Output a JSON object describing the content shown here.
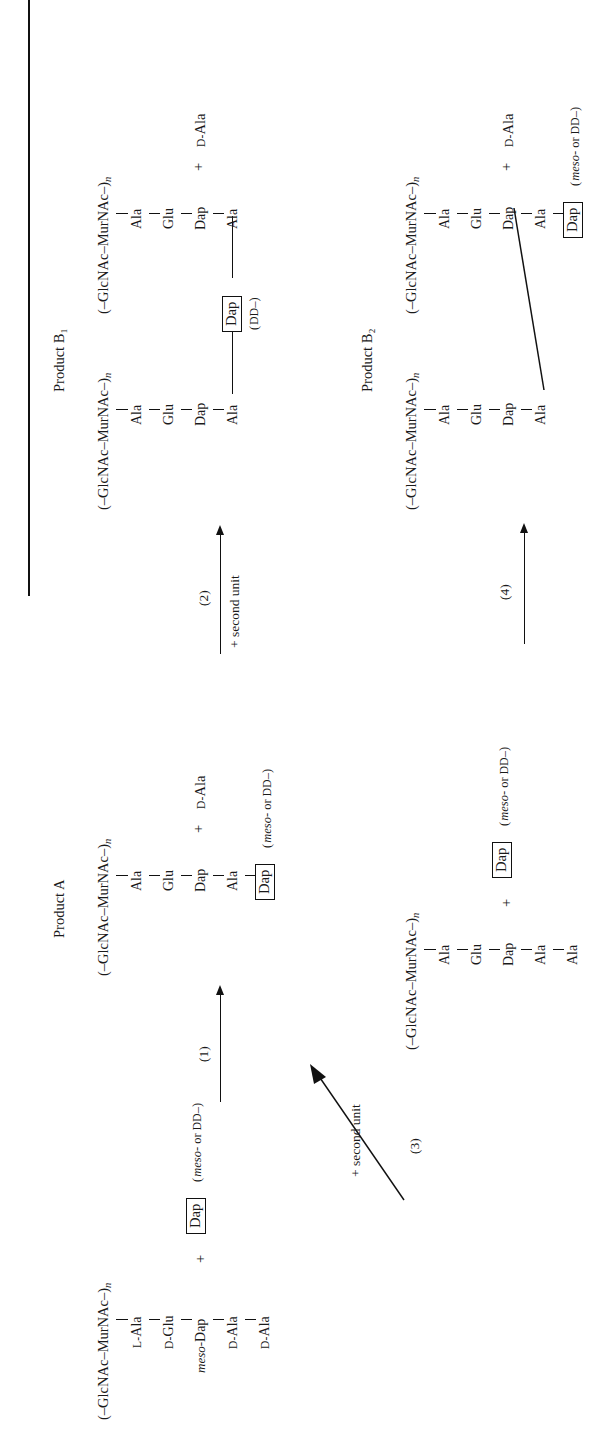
{
  "figure": {
    "orientation": "rotated-90-ccw",
    "rule_label": "figure-top-rule"
  },
  "titles": {
    "product_a": "Product A",
    "product_b1": "Product B₁",
    "product_b2": "Product B₂"
  },
  "glycan_backbone": {
    "prefix": "(–GlcNAc–MurNAc–)",
    "subscript": "n"
  },
  "substrate": {
    "name": "substrate-pentapeptide",
    "backbone": "(–GlcNAc–MurNAc–)",
    "backbone_sub": "n",
    "residues": [
      {
        "prefix": "L-",
        "label": "Ala",
        "style": "smallcaps"
      },
      {
        "prefix": "D-",
        "label": "Glu",
        "style": "smallcaps"
      },
      {
        "prefix": "meso-",
        "label": "Dap",
        "style": "italic"
      },
      {
        "prefix": "D-",
        "label": "Ala",
        "style": "smallcaps"
      },
      {
        "prefix": "D-",
        "label": "Ala",
        "style": "smallcaps"
      }
    ],
    "plus": "+",
    "acceptor_boxed": "Dap",
    "acceptor_note": "( meso- or DD–)"
  },
  "product_a": {
    "name": "product-a-structure",
    "backbone": "(–GlcNAc–MurNAc–)",
    "backbone_sub": "n",
    "residues": [
      "Ala",
      "Glu",
      "Dap",
      "Ala"
    ],
    "boxed_residue": "Dap",
    "boxed_note": "( meso- or DD–)",
    "released": "+ D-Ala",
    "released_plus": "+",
    "released_prefix": "D-",
    "released_label": "Ala"
  },
  "product_b1": {
    "name": "product-b1-structure",
    "left_chain": {
      "backbone": "(–GlcNAc–MurNAc–)",
      "backbone_sub": "n",
      "residues": [
        "Ala",
        "Glu",
        "Dap",
        "Ala"
      ]
    },
    "right_chain": {
      "backbone": "(–GlcNAc–MurNAc–)",
      "backbone_sub": "n",
      "residues": [
        "Ala",
        "Glu",
        "Dap",
        "Ala"
      ]
    },
    "bridge_boxed": "Dap",
    "bridge_note": "( DD–)",
    "released_plus": "+",
    "released_prefix": "D-",
    "released_label": "Ala"
  },
  "intermediate": {
    "name": "intermediate-tetra-plus-ala",
    "backbone": "(–GlcNAc–MurNAc–)",
    "backbone_sub": "n",
    "residues": [
      "Ala",
      "Glu",
      "Dap",
      "Ala",
      "Ala"
    ],
    "plus": "+",
    "acceptor_boxed": "Dap",
    "acceptor_note": "( meso- or DD–)",
    "released_plus": "+",
    "released_prefix": "D-",
    "released_label": "Ala"
  },
  "product_b2": {
    "name": "product-b2-structure",
    "left_chain": {
      "backbone": "(–GlcNAc–MurNAc–)",
      "backbone_sub": "n",
      "residues": [
        "Ala",
        "Glu",
        "Dap",
        "Ala"
      ]
    },
    "right_chain": {
      "backbone": "(–GlcNAc–MurNAc–)",
      "backbone_sub": "n",
      "residues": [
        "Ala",
        "Glu",
        "Dap",
        "Ala"
      ]
    },
    "boxed_residue": "Dap",
    "boxed_note": "( meso- or DD–)",
    "released_plus": "+",
    "released_prefix": "D-",
    "released_label": "Ala"
  },
  "arrows": {
    "a1": {
      "number": "(1)",
      "caption": ""
    },
    "a2": {
      "number": "(2)",
      "caption": "+ second unit"
    },
    "a3": {
      "number": "(3)",
      "caption": "+ second unit"
    },
    "a4": {
      "number": "(4)",
      "caption": ""
    }
  },
  "symbols": {
    "plus": "+",
    "d_prefix": "D-",
    "l_prefix": "L-",
    "meso_prefix": "meso-",
    "ala": "Ala",
    "glu": "Glu",
    "dap": "Dap",
    "dd": "DD–",
    "meso_or_dd": "( meso- or DD–)",
    "dd_only": "( DD–)"
  },
  "colors": {
    "ink": "#111111",
    "paper": "#ffffff"
  }
}
